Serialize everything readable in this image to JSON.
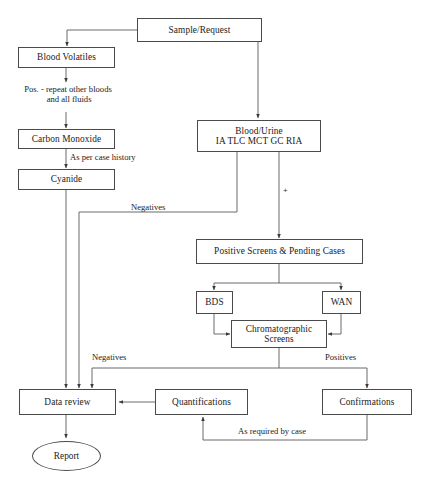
{
  "diagram": {
    "stroke_color": "#4a4a4a",
    "text_color": "#1a1a1a",
    "background": "#ffffff"
  },
  "nodes": {
    "sample_request": {
      "label": "Sample/Request"
    },
    "blood_volatiles": {
      "label": "Blood Volatiles"
    },
    "carbon_monoxide": {
      "label": "Carbon Monoxide"
    },
    "cyanide": {
      "label": "Cyanide"
    },
    "blood_urine": {
      "line1": "Blood/Urine",
      "line2": "IA  TLC  MCT  GC  RIA"
    },
    "positive_screens": {
      "label": "Positive Screens & Pending Cases"
    },
    "bds": {
      "label": "BDS"
    },
    "wan": {
      "label": "WAN"
    },
    "chromatographic_screens": {
      "line1": "Chromatographic",
      "line2": "Screens"
    },
    "data_review": {
      "label": "Data review"
    },
    "quantifications": {
      "label": "Quantifications"
    },
    "confirmations": {
      "label": "Confirmations"
    },
    "report": {
      "label": "Report"
    }
  },
  "edge_labels": {
    "pos_repeat": "Pos. - repeat other bloods\n and all fluids",
    "as_per_case_history": "As per case history",
    "negatives_upper": "Negatives",
    "negatives_lower": "Negatives",
    "positives": "Positives",
    "as_required_by_case": "As required by case",
    "plus": "+"
  }
}
